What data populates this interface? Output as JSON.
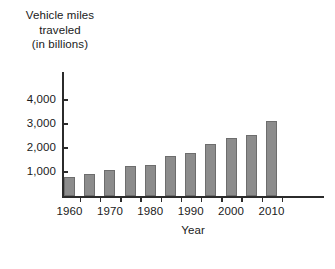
{
  "chart_data": {
    "type": "bar",
    "title": "",
    "ylabel_lines": [
      "Vehicle miles",
      "traveled",
      "(in billions)"
    ],
    "xlabel": "Year",
    "categories": [
      1960,
      1965,
      1970,
      1975,
      1980,
      1985,
      1990,
      1995,
      2000,
      2005,
      2010
    ],
    "values": [
      790,
      910,
      1100,
      1250,
      1310,
      1650,
      1790,
      2150,
      2420,
      2560,
      3120
    ],
    "ytick_labels": [
      "1,000",
      "2,000",
      "3,000",
      "4,000"
    ],
    "ytick_values": [
      1000,
      2000,
      3000,
      4000
    ],
    "xtick_labels": [
      "1960",
      "1970",
      "1980",
      "1990",
      "2000",
      "2010"
    ],
    "xtick_values": [
      1960,
      1970,
      1980,
      1990,
      2000,
      2010
    ],
    "ylim": [
      0,
      4400
    ],
    "xlim": [
      1957.5,
      2012.5
    ],
    "grid": false,
    "legend": false,
    "bar_color": "#8c8c8c",
    "bar_edge_color": "#6d6d6d",
    "axis_color": "#2b2b2b",
    "background": "#ffffff"
  }
}
